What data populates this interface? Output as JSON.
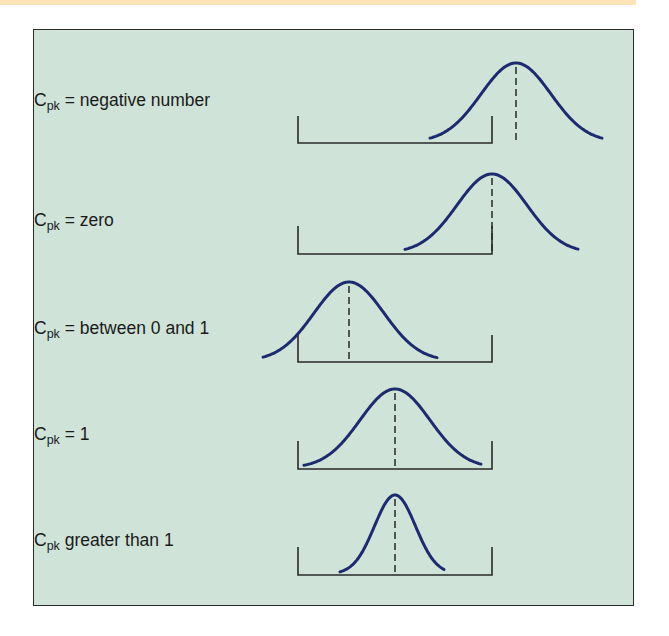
{
  "figure": {
    "title": "",
    "colors": {
      "background": "#cfe3d9",
      "curve": "#1c2b6e",
      "spec_limits": "#2a2a2a",
      "border": "#2c2c2c"
    },
    "rows": [
      {
        "label_main": "C",
        "label_sub": "pk",
        "label_rest": " = negative number",
        "mean_position": "right of upper spec limit"
      },
      {
        "label_main": "C",
        "label_sub": "pk",
        "label_rest": " = zero",
        "mean_position": "at upper spec limit"
      },
      {
        "label_main": "C",
        "label_sub": "pk",
        "label_rest": " = between 0 and 1",
        "mean_position": "inside limits, tail beyond lower limit"
      },
      {
        "label_main": "C",
        "label_sub": "pk",
        "label_rest": " = 1",
        "mean_position": "centered, tails touch limits"
      },
      {
        "label_main": "C",
        "label_sub": "pk",
        "label_rest": " greater than 1",
        "mean_position": "centered, narrow distribution"
      }
    ]
  }
}
